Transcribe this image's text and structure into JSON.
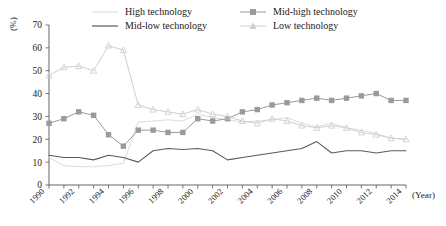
{
  "chart_data": {
    "type": "line",
    "title": "",
    "xlabel": "(Year)",
    "ylabel": "(%)",
    "xlim": [
      1990,
      2014
    ],
    "ylim": [
      0,
      70
    ],
    "ytick_step": 10,
    "yticks": [
      0,
      10,
      20,
      30,
      40,
      50,
      60,
      70
    ],
    "xticks_labeled": [
      1990,
      1992,
      1994,
      1996,
      1998,
      2000,
      2002,
      2004,
      2006,
      2008,
      2010,
      2012,
      2014
    ],
    "xtick_every": 1,
    "grid": false,
    "legend_position": "top",
    "x": [
      1990,
      1991,
      1992,
      1993,
      1994,
      1995,
      1996,
      1997,
      1998,
      1999,
      2000,
      2001,
      2002,
      2003,
      2004,
      2005,
      2006,
      2007,
      2008,
      2009,
      2010,
      2011,
      2012,
      2013,
      2014
    ],
    "series": [
      {
        "name": "High technology",
        "color": "#dcdcdc",
        "marker": "none",
        "values": [
          12.0,
          8.5,
          8.0,
          8.0,
          8.5,
          9.5,
          27.5,
          28.0,
          28.5,
          28.0,
          31.0,
          29.5,
          28.5,
          27.5,
          28.0,
          28.5,
          29.5,
          27.0,
          25.5,
          27.0,
          25.0,
          24.0,
          22.5,
          20.5,
          20.0
        ]
      },
      {
        "name": "Mid-high technology",
        "color": "#9a9a9a",
        "marker": "square",
        "values": [
          27.0,
          29.0,
          32.0,
          30.5,
          22.0,
          17.0,
          24.0,
          24.0,
          23.0,
          23.0,
          29.0,
          28.0,
          29.0,
          32.0,
          33.0,
          35.0,
          36.0,
          37.0,
          38.0,
          37.0,
          38.0,
          39.0,
          40.0,
          37.0,
          37.0
        ]
      },
      {
        "name": "Mid-low technology",
        "color": "#5a5a5a",
        "marker": "none",
        "values": [
          13.0,
          12.0,
          12.0,
          11.0,
          13.0,
          12.0,
          10.0,
          15.0,
          16.0,
          15.5,
          16.0,
          15.0,
          11.0,
          12.0,
          13.0,
          14.0,
          15.0,
          16.0,
          19.0,
          14.0,
          15.0,
          15.0,
          14.0,
          15.0,
          15.0
        ]
      },
      {
        "name": "Low technology",
        "color": "#cfcfcf",
        "marker": "triangle",
        "values": [
          48.0,
          51.5,
          52.0,
          50.0,
          61.0,
          59.0,
          35.0,
          33.0,
          32.0,
          31.0,
          33.0,
          31.0,
          30.0,
          28.0,
          27.0,
          29.0,
          28.0,
          26.0,
          25.0,
          26.0,
          25.0,
          23.0,
          22.0,
          20.5,
          20.0
        ]
      }
    ]
  },
  "legend": {
    "items": [
      {
        "label": "High technology"
      },
      {
        "label": "Mid-high technology"
      },
      {
        "label": "Mid-low technology"
      },
      {
        "label": "Low technology"
      }
    ]
  },
  "axes": {
    "y_title": "(%)",
    "x_title": "(Year)"
  }
}
